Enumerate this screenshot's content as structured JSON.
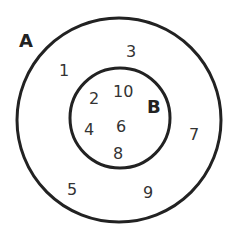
{
  "diagram": {
    "type": "venn-subset",
    "stroke_color": "#222222",
    "sets": [
      {
        "label": "A",
        "elements_only": [
          "1",
          "3",
          "5",
          "7",
          "9"
        ]
      },
      {
        "label": "B",
        "elements": [
          "2",
          "10",
          "4",
          "6",
          "8"
        ]
      }
    ],
    "outer_label": "A",
    "inner_label": "B",
    "outer_numbers": [
      "1",
      "3",
      "7",
      "5",
      "9"
    ],
    "inner_numbers": [
      "2",
      "10",
      "4",
      "6",
      "8"
    ]
  }
}
